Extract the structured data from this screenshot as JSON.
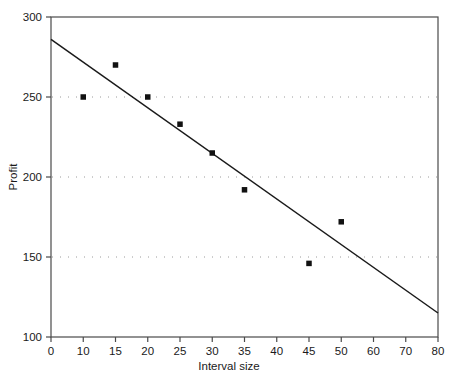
{
  "chart_data": {
    "type": "scatter",
    "title": "",
    "xlabel": "Interval size",
    "ylabel": "Profit",
    "x": [
      10,
      15,
      20,
      25,
      30,
      35,
      45,
      50
    ],
    "values": [
      250,
      270,
      250,
      233,
      215,
      192,
      146,
      172
    ],
    "series": [
      {
        "name": "Profit observations",
        "marker": "filled-square",
        "color": "#111111",
        "points": [
          {
            "x": 10,
            "y": 250
          },
          {
            "x": 15,
            "y": 270
          },
          {
            "x": 20,
            "y": 250
          },
          {
            "x": 25,
            "y": 233
          },
          {
            "x": 30,
            "y": 215
          },
          {
            "x": 35,
            "y": 192
          },
          {
            "x": 45,
            "y": 146
          },
          {
            "x": 50,
            "y": 172
          }
        ]
      },
      {
        "name": "Trend line",
        "marker": "none",
        "color": "#1a1a1a",
        "line": [
          {
            "x": 0,
            "y": 286
          },
          {
            "x": 80,
            "y": 115
          }
        ]
      }
    ],
    "xticks": [
      0,
      10,
      15,
      20,
      25,
      30,
      35,
      40,
      45,
      50,
      60,
      70,
      80
    ],
    "xtick_labels": [
      "0",
      "10",
      "15",
      "20",
      "25",
      "30",
      "35",
      "40",
      "45",
      "50",
      "60",
      "70",
      "80"
    ],
    "xtick_spacing": "even",
    "yticks": [
      100,
      150,
      200,
      250,
      300
    ],
    "ytick_labels": [
      "100",
      "150",
      "200",
      "250",
      "300"
    ],
    "ylim": [
      100,
      300
    ],
    "grid": {
      "horizontal": true,
      "vertical": false,
      "style": "dotted",
      "levels": [
        150,
        200,
        250
      ],
      "color": "#9a9a9a"
    },
    "legend": "none",
    "frame": "box",
    "axis_color": "#4a4a4a"
  },
  "axes": {
    "x_title": "Interval size",
    "y_title": "Profit"
  }
}
